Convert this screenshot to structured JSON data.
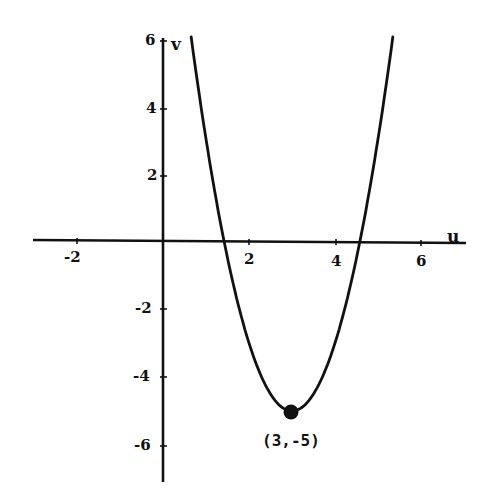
{
  "chart_data": {
    "type": "line",
    "title": "",
    "function": "v = 2(u - 3)^2 - 5",
    "xlabel": "u",
    "ylabel": "v",
    "xlim": [
      -3,
      7
    ],
    "ylim": [
      -7,
      6
    ],
    "x_ticks": [
      -2,
      2,
      4,
      6
    ],
    "y_ticks": [
      6,
      4,
      2,
      -2,
      -4,
      -6
    ],
    "x_tick_labels": [
      "-2",
      "2",
      "4",
      "6"
    ],
    "y_tick_labels": [
      "6",
      "4",
      "2",
      "-2",
      "-4",
      "-6"
    ],
    "grid": false,
    "legend": null,
    "series": [
      {
        "name": "parabola",
        "x": [
          0.6,
          1.0,
          1.42,
          2.0,
          2.5,
          3.0,
          3.5,
          4.0,
          4.58,
          5.0,
          5.4
        ],
        "y": [
          6.52,
          3.0,
          0.0,
          -3.0,
          -4.5,
          -5.0,
          -4.5,
          -3.0,
          0.0,
          3.0,
          6.52
        ]
      }
    ],
    "annotations": [
      {
        "type": "point",
        "x": 3,
        "y": -5,
        "label": "(3,-5)"
      }
    ],
    "roots": [
      1.42,
      4.58
    ],
    "vertex": [
      3,
      -5
    ]
  },
  "labels": {
    "x_axis_name": "u",
    "y_axis_name": "v",
    "vertex_label": "(3,-5)",
    "x_tick_neg2": "-2",
    "x_tick_2": "2",
    "x_tick_4": "4",
    "x_tick_6": "6",
    "y_tick_6": "6",
    "y_tick_4": "4",
    "y_tick_2": "2",
    "y_tick_neg2": "-2",
    "y_tick_neg4": "-4",
    "y_tick_neg6": "-6"
  },
  "colors": {
    "ink": "#111111",
    "background": "#ffffff"
  }
}
